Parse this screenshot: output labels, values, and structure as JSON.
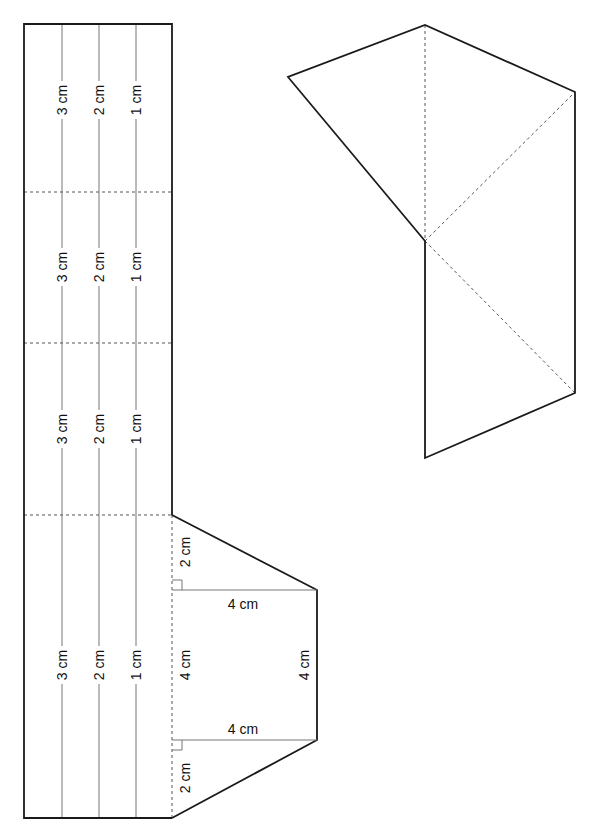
{
  "diagram": {
    "type": "net-and-3d-solid",
    "net": {
      "strip": {
        "panel_labels": {
          "line_outer": "3 cm",
          "line_middle": "2 cm",
          "line_inner": "1 cm"
        },
        "panels": [
          {
            "id": 1,
            "labels": [
              "3 cm",
              "2 cm",
              "1 cm"
            ]
          },
          {
            "id": 2,
            "labels": [
              "3 cm",
              "2 cm",
              "1 cm"
            ]
          },
          {
            "id": 3,
            "labels": [
              "3 cm",
              "2 cm",
              "1 cm"
            ]
          },
          {
            "id": 4,
            "labels": [
              "3 cm",
              "2 cm",
              "1 cm"
            ]
          }
        ]
      },
      "face": {
        "top_leg": "2 cm",
        "top_width": "4 cm",
        "inner_height": "4 cm",
        "outer_height": "4 cm",
        "bottom_width": "4 cm",
        "bottom_leg": "2 cm"
      }
    },
    "solid": {
      "description": "3D wedge with dashed hidden/fold edges"
    }
  }
}
